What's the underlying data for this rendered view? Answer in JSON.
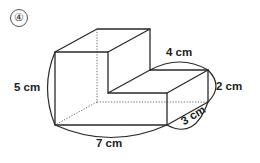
{
  "problem": {
    "number_label": "④"
  },
  "figure": {
    "shape": "L-shaped prism (cuboid with step removed)",
    "dimensions": {
      "height": "5 cm",
      "width": "7 cm",
      "depth": "3 cm",
      "step_width": "4 cm",
      "step_height": "2 cm"
    }
  },
  "colors": {
    "line": "#2a2a2a",
    "hidden_line": "#555555",
    "background": "#ffffff"
  }
}
